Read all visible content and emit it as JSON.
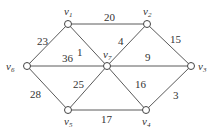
{
  "graph": {
    "nodes": [
      {
        "id": "v1",
        "label": "v",
        "sub": "1",
        "x": 68,
        "y": 24,
        "lx": 64,
        "ly": 15,
        "anchor": "start"
      },
      {
        "id": "v2",
        "label": "v",
        "sub": "2",
        "x": 147,
        "y": 24,
        "lx": 143,
        "ly": 15,
        "anchor": "start"
      },
      {
        "id": "v3",
        "label": "v",
        "sub": "3",
        "x": 191,
        "y": 66,
        "lx": 198,
        "ly": 70,
        "anchor": "start"
      },
      {
        "id": "v4",
        "label": "v",
        "sub": "4",
        "x": 146,
        "y": 110,
        "lx": 142,
        "ly": 125,
        "anchor": "start"
      },
      {
        "id": "v5",
        "label": "v",
        "sub": "5",
        "x": 68,
        "y": 110,
        "lx": 64,
        "ly": 125,
        "anchor": "start"
      },
      {
        "id": "v6",
        "label": "v",
        "sub": "6",
        "x": 27,
        "y": 66,
        "lx": 6,
        "ly": 70,
        "anchor": "start"
      },
      {
        "id": "v7",
        "label": "v",
        "sub": "7",
        "x": 107,
        "y": 66,
        "lx": 103,
        "ly": 58,
        "anchor": "start"
      }
    ],
    "edges": [
      {
        "from": "v1",
        "to": "v2",
        "weight": "20",
        "lx": 104,
        "ly": 21
      },
      {
        "from": "v1",
        "to": "v6",
        "weight": "23",
        "lx": 37,
        "ly": 45
      },
      {
        "from": "v1",
        "to": "v7",
        "weight": "1",
        "lx": 77,
        "ly": 56
      },
      {
        "from": "v6",
        "to": "v7",
        "weight": "36",
        "lx": 62,
        "ly": 62
      },
      {
        "from": "v2",
        "to": "v7",
        "weight": "4",
        "lx": 118,
        "ly": 45
      },
      {
        "from": "v2",
        "to": "v3",
        "weight": "15",
        "lx": 170,
        "ly": 43
      },
      {
        "from": "v7",
        "to": "v3",
        "weight": "9",
        "lx": 145,
        "ly": 61
      },
      {
        "from": "v6",
        "to": "v5",
        "weight": "28",
        "lx": 30,
        "ly": 98
      },
      {
        "from": "v7",
        "to": "v5",
        "weight": "25",
        "lx": 73,
        "ly": 88
      },
      {
        "from": "v7",
        "to": "v4",
        "weight": "16",
        "lx": 135,
        "ly": 88
      },
      {
        "from": "v3",
        "to": "v4",
        "weight": "3",
        "lx": 173,
        "ly": 99
      },
      {
        "from": "v5",
        "to": "v4",
        "weight": "17",
        "lx": 101,
        "ly": 123
      }
    ]
  }
}
